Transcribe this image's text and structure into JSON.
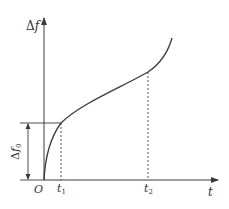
{
  "diagram": {
    "type": "frequency-shift vs time curve",
    "colors": {
      "line": "#3a3a3a",
      "background": "#ffffff"
    },
    "axes": {
      "y_label_delta": "Δ",
      "y_label_var": "f",
      "x_label": "t",
      "origin_label": "O"
    },
    "ticks": {
      "t1_base": "t",
      "t1_sub": "1",
      "t2_base": "t",
      "t2_sub": "2"
    },
    "annotation": {
      "delta": "Δ",
      "var": "f",
      "sub": "0"
    }
  }
}
